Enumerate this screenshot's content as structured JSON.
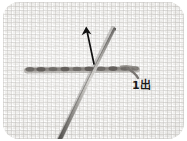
{
  "figure": {
    "kind": "instructional-photograph",
    "width": 187,
    "height": 141,
    "plate": {
      "corner_radius": "16px",
      "border_color": "#ffffff"
    }
  },
  "fabric": {
    "name": "woven-linen-ground",
    "base_color": "#f0efed",
    "thread_color": "#c6c4c0",
    "highlight_color": "#ffffff",
    "weave_pitch_px": 4
  },
  "stitch_line": {
    "name": "running-stitch-row",
    "color": "#6e6a66",
    "shadow_color": "#9a9690",
    "start_x": 27,
    "end_x": 137,
    "y": 70,
    "thickness": 4,
    "stitch_count": 9
  },
  "needle": {
    "name": "sewing-needle",
    "color": "#8e8c88",
    "edge_color": "#5c5a57",
    "tip_x": 112,
    "tip_y": 27,
    "base_x": 57,
    "base_y": 141,
    "eye_visible": false
  },
  "thread_tail": {
    "name": "emerging-thread-tail",
    "color": "#7a7672",
    "description": "thread curving down-right from the fabric surface toward the caption"
  },
  "direction_arrow": {
    "name": "stitch-direction-arrow",
    "color": "#111111",
    "points": "up",
    "tail_x": 94,
    "tail_y": 63,
    "head_x": 86,
    "head_y": 27,
    "stroke_width": 1.6
  },
  "caption": {
    "name": "point-label",
    "text": "1出",
    "meaning_visible_text_only": true,
    "color": "#1a1a1a",
    "x": 129,
    "y": 78,
    "font_size_px": 11
  }
}
